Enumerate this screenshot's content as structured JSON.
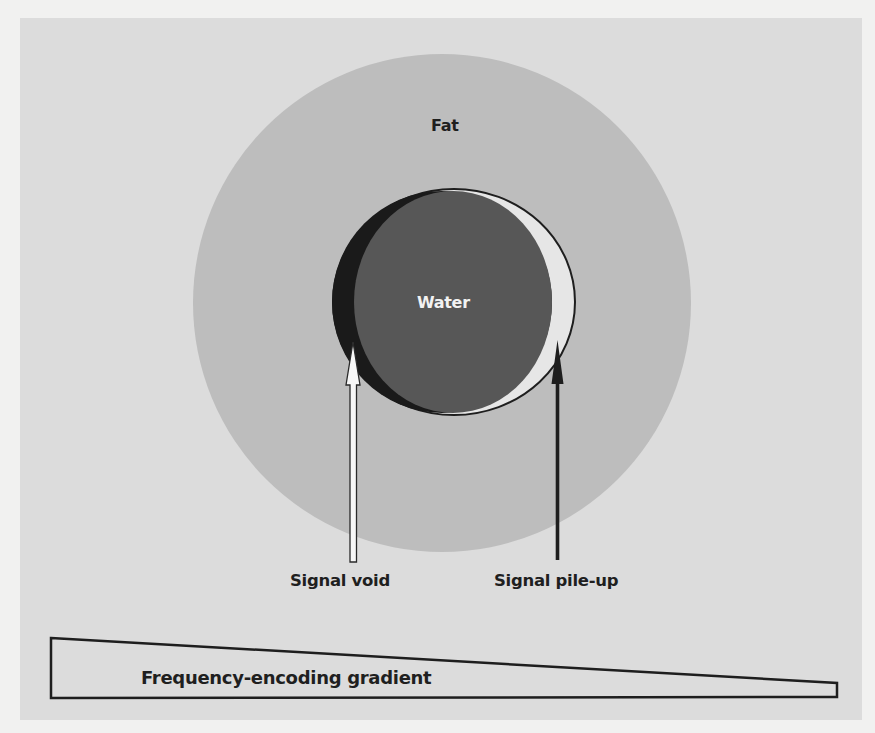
{
  "diagram": {
    "regions": {
      "fat": {
        "label": "Fat",
        "color": "#bdbdbd"
      },
      "water": {
        "label": "Water",
        "color": "#575757"
      }
    },
    "annotations": {
      "signal_void": {
        "label": "Signal void",
        "arrow_color": "#ffffff"
      },
      "signal_pileup": {
        "label": "Signal pile-up",
        "arrow_color": "#1e1e1e"
      }
    },
    "gradient": {
      "label": "Frequency-encoding gradient",
      "shape": "wedge tapering left-to-right"
    },
    "colors": {
      "page_background": "#f1f1f0",
      "panel_background": "#dcdcdc",
      "void_crescent": "#1a1a1a",
      "pileup_crescent": "#e6e6e6",
      "outline": "#1e1e1e"
    }
  }
}
